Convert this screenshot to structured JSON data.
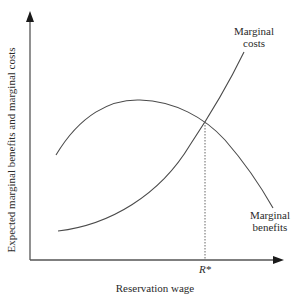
{
  "diagram": {
    "type": "economics-curve-diagram",
    "axes": {
      "x_label": "Reservation wage",
      "y_label": "Expected marginal benefits and marginal costs"
    },
    "curves": [
      {
        "id": "marginal-costs",
        "label_line1": "Marginal",
        "label_line2": "costs",
        "shape": "increasing-convex"
      },
      {
        "id": "marginal-benefits",
        "label_line1": "Marginal",
        "label_line2": "benefits",
        "shape": "inverted-u"
      }
    ],
    "equilibrium": {
      "label": "R*",
      "description": "Intersection of marginal costs and marginal benefits"
    },
    "colors": {
      "curve": "#4a4a4a",
      "axis": "#555555",
      "text": "#2a2a2a"
    }
  }
}
